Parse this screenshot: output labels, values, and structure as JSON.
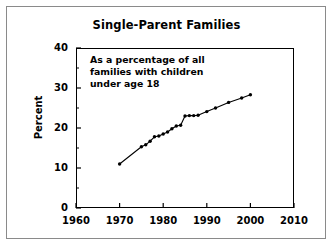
{
  "chart_data": {
    "type": "line",
    "title": "Single-Parent Families",
    "annotation": [
      "As a percentage of all",
      "families with children",
      "under age 18"
    ],
    "xlabel": "",
    "ylabel": "Percent",
    "xlim": [
      1960,
      2010
    ],
    "ylim": [
      0,
      40
    ],
    "xticks": [
      1960,
      1970,
      1980,
      1990,
      2000,
      2010
    ],
    "yticks": [
      0,
      10,
      20,
      30,
      40
    ],
    "yminorticks": [
      5,
      15,
      25,
      35
    ],
    "grid": false,
    "legend": "none",
    "marker": "filled-circle",
    "line_color": "#000000",
    "marker_color": "#000000",
    "series": [
      {
        "name": "Single-parent families",
        "x": [
          1970,
          1975,
          1976,
          1977,
          1978,
          1979,
          1980,
          1981,
          1982,
          1983,
          1984,
          1985,
          1986,
          1987,
          1988,
          1990,
          1992,
          1995,
          1998,
          2000
        ],
        "values": [
          11.0,
          15.3,
          15.8,
          16.7,
          17.8,
          18.0,
          18.5,
          19.0,
          19.8,
          20.5,
          20.7,
          23.0,
          23.1,
          23.1,
          23.2,
          24.1,
          25.0,
          26.4,
          27.5,
          28.3
        ]
      }
    ]
  },
  "axis": {
    "y_tick_labels": [
      "0",
      "10",
      "20",
      "30",
      "40"
    ],
    "x_tick_labels": [
      "1960",
      "1970",
      "1980",
      "1990",
      "2000",
      "2010"
    ],
    "y_axis_title": "Percent"
  },
  "annotation_lines": {
    "line1": "As a percentage of all",
    "line2": "families with children",
    "line3": "under age 18"
  },
  "title": {
    "text": "Single-Parent Families"
  }
}
